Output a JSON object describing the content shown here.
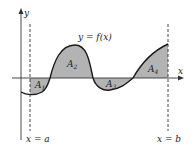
{
  "diagram": {
    "type": "area-under-curve",
    "curve_label": "y = f(x)",
    "axis_labels": {
      "x": "x",
      "y": "y"
    },
    "bounds": {
      "left": "x = a",
      "right": "x = b"
    },
    "regions": [
      {
        "name": "A",
        "sub": "1",
        "sign": "below"
      },
      {
        "name": "A",
        "sub": "2",
        "sign": "above"
      },
      {
        "name": "A",
        "sub": "3",
        "sign": "below"
      },
      {
        "name": "A",
        "sub": "4",
        "sign": "above"
      }
    ],
    "colors": {
      "fill": "#b3b3b3",
      "stroke": "#1a1a1a",
      "axis": "#333333"
    }
  }
}
